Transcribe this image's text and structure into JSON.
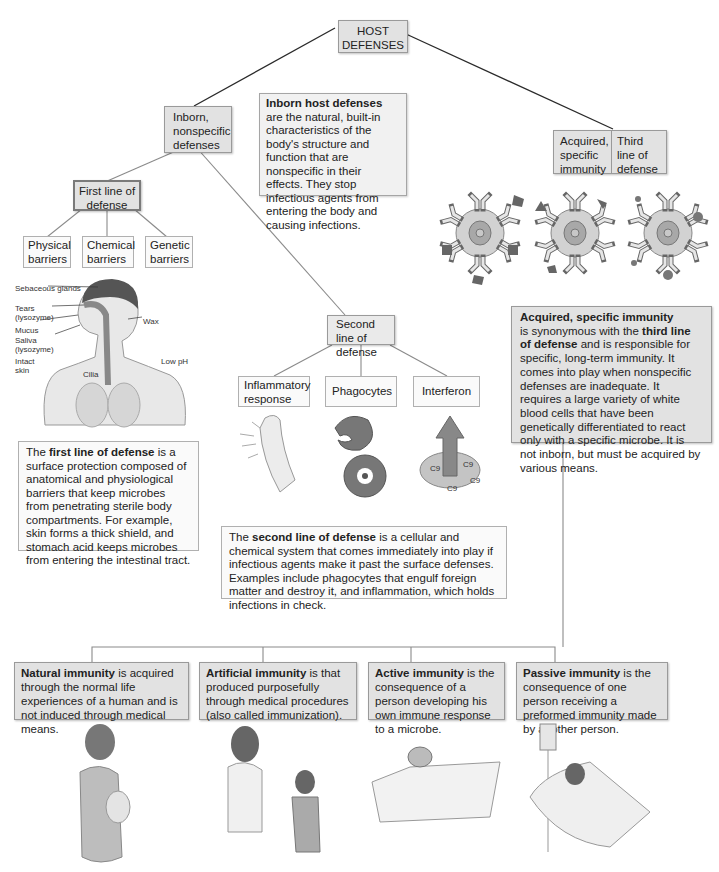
{
  "root": {
    "label": "HOST DEFENSES"
  },
  "inborn": {
    "label": "Inborn, nonspecific defenses",
    "desc_title": "Inborn host defenses",
    "desc_body": "are the natural, built-in characteristics of the body's structure and function that are nonspecific in their effects. They stop infectious agents from entering the body and causing infections."
  },
  "acquired": {
    "label": "Acquired, specific immunity",
    "side_label": "Third line of defense",
    "desc_title": "Acquired, specific immunity",
    "desc_mid1": " is synonymous with the ",
    "desc_bold2": "third line of defense",
    "desc_body": " and is responsible for specific, long-term immunity. It comes into play when nonspecific defenses are inadequate. It requires a large variety of white blood cells that have been genetically differentiated to react only with a specific microbe. It is not inborn, but must be acquired by various means."
  },
  "first_line": {
    "label": "First line of defense",
    "children": [
      "Physical barriers",
      "Chemical barriers",
      "Genetic barriers"
    ],
    "illustration_labels": {
      "sebaceous": "Sebaceous glands",
      "tears": "Tears (lysozyme)",
      "mucus": "Mucus",
      "saliva": "Saliva (lysozyme)",
      "skin": "Intact skin",
      "cilia": "Cilia",
      "wax": "Wax",
      "ph": "Low pH"
    },
    "desc_pre": "The ",
    "desc_bold": "first line of defense",
    "desc_body": " is a surface protection composed of anatomical and physiological barriers that keep microbes from penetrating sterile body compartments. For example, skin forms a thick shield, and stomach acid keeps microbes from entering the intestinal tract."
  },
  "second_line": {
    "label": "Second line of defense",
    "children": [
      "Inflammatory response",
      "Phagocytes",
      "Interferon"
    ],
    "complement_label": "C9",
    "desc_pre": "The ",
    "desc_bold": "second line of defense",
    "desc_body": " is a cellular and chemical system that comes immediately into play if infectious agents make it past the surface defenses. Examples include phagocytes that engulf foreign matter and destroy it, and inflammation, which holds infections in check."
  },
  "immunity_types": [
    {
      "title": "Natural immunity",
      "body": " is acquired through the normal life experiences of a human and is not induced through medical means."
    },
    {
      "title": "Artificial immunity",
      "body": " is that produced purposefully through medical procedures (also called immunization)."
    },
    {
      "title": "Active immunity",
      "body": " is the consequence of a person developing his own immune response to a microbe."
    },
    {
      "title": "Passive immunity",
      "body": " is the consequence of one person receiving a preformed immunity made by another person."
    }
  ],
  "colors": {
    "box_fill": "#e2e2e2",
    "line": "#7a7a7a",
    "cell": "#c8c8c8",
    "antigen": "#6a6a6a"
  }
}
